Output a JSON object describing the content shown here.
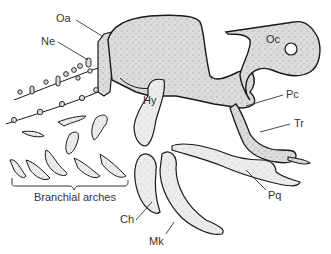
{
  "figure": {
    "colors": {
      "cartilage_fill": "#d9d9d9",
      "cartilage_fill_light": "#e8e8e8",
      "outline": "#1a1a1a",
      "leader_line": "#333333",
      "label_text": "#333333",
      "background": "#ffffff"
    },
    "labels": {
      "oa": "Oa",
      "ne": "Ne",
      "oc": "Oc",
      "hy": "Hy",
      "pc": "Pc",
      "tr": "Tr",
      "pq": "Pq",
      "ch": "Ch",
      "mk": "Mk",
      "branchial": "Branchial arches"
    }
  }
}
